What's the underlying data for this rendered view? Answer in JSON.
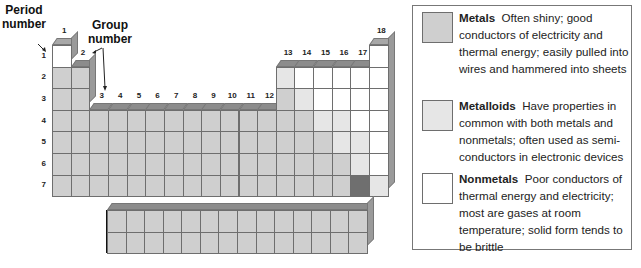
{
  "callouts": {
    "period_number": "Period\nnumber",
    "period_line1": "Period",
    "period_line2": "number",
    "group_line1": "Group",
    "group_line2": "number"
  },
  "periodic_table": {
    "group_labels": [
      "1",
      "2",
      "3",
      "4",
      "5",
      "6",
      "7",
      "8",
      "9",
      "10",
      "11",
      "12",
      "13",
      "14",
      "15",
      "16",
      "17",
      "18"
    ],
    "period_labels": [
      "1",
      "2",
      "3",
      "4",
      "5",
      "6",
      "7"
    ],
    "colors": {
      "metal": "#cfcfcf",
      "metalloid": "#e6e6e6",
      "nonmetal": "#ffffff",
      "dark": "#6f6f6f",
      "bevel": "#8c8c8c",
      "side": "#9a9a9a",
      "grid": "#6e6e6e"
    }
  },
  "legend": {
    "items": [
      {
        "title": "Metals",
        "color": "#cfcfcf",
        "description": "Often shiny; good conductors of electricity and thermal energy; easily pulled into wires and hammered into sheets"
      },
      {
        "title": "Metalloids",
        "color": "#e6e6e6",
        "description": "Have properties in common with both metals and nonmetals; often used as semi-conductors in electronic devices"
      },
      {
        "title": "Nonmetals",
        "color": "#ffffff",
        "description": "Poor conductors of thermal energy and electricity; most are gases at room temperature; solid form tends to be brittle"
      }
    ]
  }
}
